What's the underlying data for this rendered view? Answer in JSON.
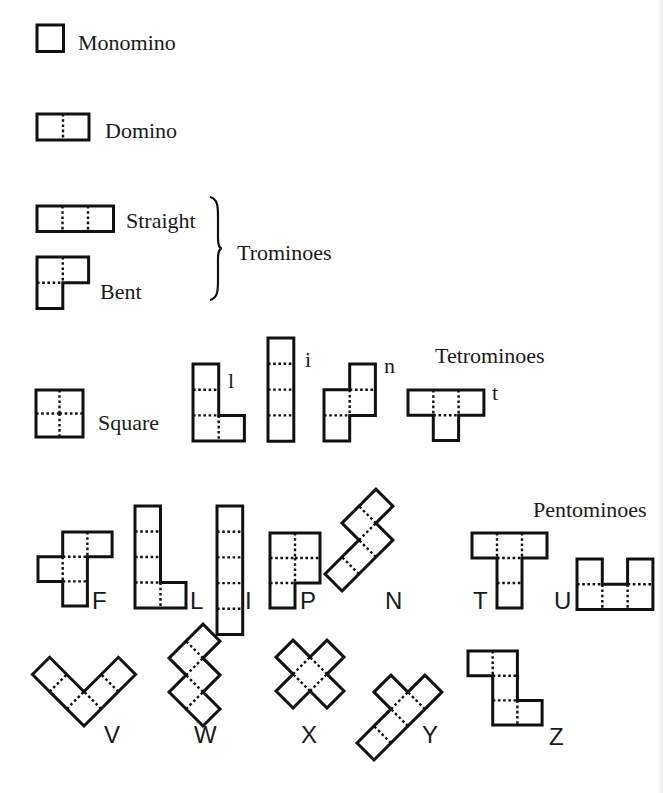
{
  "diagram": {
    "groups": [
      {
        "id": "monomino",
        "label": "Monomino"
      },
      {
        "id": "domino",
        "label": "Domino"
      },
      {
        "id": "trominoes",
        "label": "Trominoes"
      },
      {
        "id": "tetrominoes",
        "label": "Tetrominoes"
      },
      {
        "id": "pentominoes",
        "label": "Pentominoes"
      }
    ],
    "labels": [
      {
        "id": "monomino",
        "text": "Monomino",
        "x": 78,
        "y": 50,
        "size": 22,
        "font": "serif"
      },
      {
        "id": "domino",
        "text": "Domino",
        "x": 105,
        "y": 138,
        "size": 22,
        "font": "serif"
      },
      {
        "id": "straight",
        "text": "Straight",
        "x": 126,
        "y": 228,
        "size": 22,
        "font": "serif"
      },
      {
        "id": "bent",
        "text": "Bent",
        "x": 100,
        "y": 299,
        "size": 22,
        "font": "serif"
      },
      {
        "id": "trominoes",
        "text": "Trominoes",
        "x": 237,
        "y": 260,
        "size": 22,
        "font": "serif"
      },
      {
        "id": "square",
        "text": "Square",
        "x": 98,
        "y": 430,
        "size": 22,
        "font": "serif"
      },
      {
        "id": "tet-l",
        "text": "l",
        "x": 228,
        "y": 388,
        "size": 22,
        "font": "serif"
      },
      {
        "id": "tet-i",
        "text": "i",
        "x": 305,
        "y": 367,
        "size": 22,
        "font": "serif"
      },
      {
        "id": "tet-n",
        "text": "n",
        "x": 384,
        "y": 373,
        "size": 22,
        "font": "serif"
      },
      {
        "id": "tetrominoes",
        "text": "Tetrominoes",
        "x": 435,
        "y": 363,
        "size": 22,
        "font": "serif"
      },
      {
        "id": "tet-t",
        "text": "t",
        "x": 492,
        "y": 400,
        "size": 22,
        "font": "serif"
      },
      {
        "id": "pentominoes",
        "text": "Pentominoes",
        "x": 533,
        "y": 517,
        "size": 22,
        "font": "serif"
      },
      {
        "id": "pent-F",
        "text": "F",
        "x": 92,
        "y": 609,
        "size": 24,
        "font": "sans"
      },
      {
        "id": "pent-L",
        "text": "L",
        "x": 190,
        "y": 609,
        "size": 24,
        "font": "sans"
      },
      {
        "id": "pent-I",
        "text": "I",
        "x": 245,
        "y": 609,
        "size": 24,
        "font": "sans"
      },
      {
        "id": "pent-P",
        "text": "P",
        "x": 300,
        "y": 609,
        "size": 24,
        "font": "sans"
      },
      {
        "id": "pent-N",
        "text": "N",
        "x": 385,
        "y": 609,
        "size": 24,
        "font": "sans"
      },
      {
        "id": "pent-T",
        "text": "T",
        "x": 473,
        "y": 609,
        "size": 24,
        "font": "sans"
      },
      {
        "id": "pent-U",
        "text": "U",
        "x": 554,
        "y": 609,
        "size": 24,
        "font": "sans"
      },
      {
        "id": "pent-V",
        "text": "V",
        "x": 104,
        "y": 743,
        "size": 24,
        "font": "sans"
      },
      {
        "id": "pent-W",
        "text": "W",
        "x": 194,
        "y": 743,
        "size": 24,
        "font": "sans"
      },
      {
        "id": "pent-X",
        "text": "X",
        "x": 301,
        "y": 743,
        "size": 24,
        "font": "sans"
      },
      {
        "id": "pent-Y",
        "text": "Y",
        "x": 422,
        "y": 743,
        "size": 24,
        "font": "sans"
      },
      {
        "id": "pent-Z",
        "text": "Z",
        "x": 549,
        "y": 745,
        "size": 24,
        "font": "sans"
      }
    ],
    "brace": {
      "x": 210,
      "top": 197,
      "bottom": 300,
      "tip_x": 222
    },
    "pieces": [
      {
        "id": "monomino",
        "x": 37,
        "y": 25,
        "unit": 26.5,
        "cells": [
          [
            0,
            0
          ]
        ]
      },
      {
        "id": "domino",
        "x": 37,
        "y": 114,
        "unit": 26,
        "cells": [
          [
            0,
            0
          ],
          [
            1,
            0
          ]
        ]
      },
      {
        "id": "tromino-straight",
        "x": 37,
        "y": 206,
        "unit": 25.5,
        "cells": [
          [
            0,
            0
          ],
          [
            1,
            0
          ],
          [
            2,
            0
          ]
        ]
      },
      {
        "id": "tromino-bent",
        "x": 37,
        "y": 257,
        "unit": 25.8,
        "cells": [
          [
            0,
            0
          ],
          [
            1,
            0
          ],
          [
            0,
            1
          ]
        ]
      },
      {
        "id": "tetromino-square",
        "x": 36,
        "y": 390,
        "unit": 23.5,
        "cells": [
          [
            0,
            0
          ],
          [
            1,
            0
          ],
          [
            0,
            1
          ],
          [
            1,
            1
          ]
        ]
      },
      {
        "id": "tetromino-l",
        "x": 193,
        "y": 364,
        "unit": 25.7,
        "cells": [
          [
            0,
            0
          ],
          [
            0,
            1
          ],
          [
            0,
            2
          ],
          [
            1,
            2
          ]
        ]
      },
      {
        "id": "tetromino-i",
        "x": 268,
        "y": 338,
        "unit": 25.8,
        "cells": [
          [
            0,
            0
          ],
          [
            0,
            1
          ],
          [
            0,
            2
          ],
          [
            0,
            3
          ]
        ]
      },
      {
        "id": "tetromino-n",
        "x": 324,
        "y": 364,
        "unit": 25.7,
        "cells": [
          [
            1,
            0
          ],
          [
            0,
            1
          ],
          [
            1,
            1
          ],
          [
            0,
            2
          ]
        ]
      },
      {
        "id": "tetromino-t",
        "x": 408,
        "y": 390,
        "unit": 25.3,
        "cells": [
          [
            0,
            0
          ],
          [
            1,
            0
          ],
          [
            2,
            0
          ],
          [
            1,
            1
          ]
        ]
      },
      {
        "id": "pentomino-F",
        "x": 38,
        "y": 532,
        "unit": 24.7,
        "cells": [
          [
            1,
            0
          ],
          [
            2,
            0
          ],
          [
            0,
            1
          ],
          [
            1,
            1
          ],
          [
            1,
            2
          ]
        ]
      },
      {
        "id": "pentomino-L",
        "x": 135,
        "y": 506,
        "unit": 25.5,
        "cells": [
          [
            0,
            0
          ],
          [
            0,
            1
          ],
          [
            0,
            2
          ],
          [
            0,
            3
          ],
          [
            1,
            3
          ]
        ]
      },
      {
        "id": "pentomino-I",
        "x": 217,
        "y": 506,
        "unit": 25.7,
        "cells": [
          [
            0,
            0
          ],
          [
            0,
            1
          ],
          [
            0,
            2
          ],
          [
            0,
            3
          ],
          [
            0,
            4
          ]
        ]
      },
      {
        "id": "pentomino-P",
        "x": 270,
        "y": 533,
        "unit": 25,
        "cells": [
          [
            0,
            0
          ],
          [
            1,
            0
          ],
          [
            0,
            1
          ],
          [
            1,
            1
          ],
          [
            0,
            2
          ]
        ]
      },
      {
        "id": "pentomino-N",
        "x": 342,
        "y": 591,
        "unit": 24,
        "rotate": -45,
        "cells": [
          [
            0,
            0
          ],
          [
            1,
            0
          ],
          [
            2,
            0
          ],
          [
            2,
            1
          ],
          [
            3,
            1
          ]
        ],
        "flipY": true
      },
      {
        "id": "pentomino-T",
        "x": 472,
        "y": 533,
        "unit": 25,
        "cells": [
          [
            0,
            0
          ],
          [
            1,
            0
          ],
          [
            2,
            0
          ],
          [
            1,
            1
          ],
          [
            1,
            2
          ]
        ]
      },
      {
        "id": "pentomino-U",
        "x": 577,
        "y": 559,
        "unit": 25.3,
        "cells": [
          [
            0,
            0
          ],
          [
            2,
            0
          ],
          [
            0,
            1
          ],
          [
            1,
            1
          ],
          [
            2,
            1
          ]
        ]
      },
      {
        "id": "pentomino-V",
        "x": 84,
        "y": 726,
        "unit": 24.3,
        "rotate": -135,
        "cells": [
          [
            0,
            0
          ],
          [
            1,
            0
          ],
          [
            2,
            0
          ],
          [
            0,
            1
          ],
          [
            0,
            2
          ]
        ]
      },
      {
        "id": "pentomino-W",
        "x": 203,
        "y": 726,
        "unit": 24,
        "rotate": -135,
        "cells": [
          [
            0,
            0
          ],
          [
            1,
            0
          ],
          [
            1,
            1
          ],
          [
            2,
            1
          ],
          [
            2,
            2
          ]
        ]
      },
      {
        "id": "pentomino-X",
        "x": 310,
        "y": 725,
        "unit": 24,
        "rotate": -135,
        "cells": [
          [
            1,
            0
          ],
          [
            0,
            1
          ],
          [
            1,
            1
          ],
          [
            2,
            1
          ],
          [
            1,
            2
          ]
        ]
      },
      {
        "id": "pentomino-Y",
        "x": 374,
        "y": 760,
        "unit": 24,
        "rotate": -45,
        "cells": [
          [
            0,
            0
          ],
          [
            1,
            0
          ],
          [
            2,
            0
          ],
          [
            3,
            0
          ],
          [
            2,
            1
          ]
        ],
        "flipY": true
      },
      {
        "id": "pentomino-Z",
        "x": 468,
        "y": 651,
        "unit": 24.7,
        "cells": [
          [
            0,
            0
          ],
          [
            1,
            0
          ],
          [
            1,
            1
          ],
          [
            1,
            2
          ],
          [
            2,
            2
          ]
        ]
      }
    ]
  }
}
